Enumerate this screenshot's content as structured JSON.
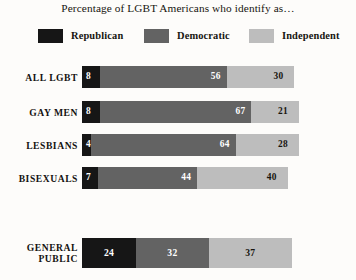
{
  "title": "Percentage of LGBT Americans who identify as…",
  "legend": {
    "items": [
      {
        "label": "Republican",
        "color": "#161616"
      },
      {
        "label": "Democratic",
        "color": "#636363"
      },
      {
        "label": "Independent",
        "color": "#bdbdbd"
      }
    ]
  },
  "colors": {
    "republican": "#161616",
    "democratic": "#636363",
    "independent": "#bdbdbd",
    "background": "#fdfcfa",
    "text": "#17150f",
    "value_light": "#ffffff"
  },
  "rows": [
    {
      "label": "ALL LGBT",
      "republican": 8,
      "democratic": 56,
      "independent": 30
    },
    {
      "label": "GAY MEN",
      "republican": 8,
      "democratic": 67,
      "independent": 21
    },
    {
      "label": "LESBIANS",
      "republican": 4,
      "democratic": 64,
      "independent": 28
    },
    {
      "label": "BISEXUALS",
      "republican": 7,
      "democratic": 44,
      "independent": 40
    },
    {
      "label": "GENERAL\nPUBLIC",
      "republican": 24,
      "democratic": 32,
      "independent": 37
    }
  ],
  "chart_data": {
    "type": "bar",
    "subtype": "horizontal-stacked",
    "title": "Percentage of LGBT Americans who identify as…",
    "xlabel": "",
    "ylabel": "",
    "categories": [
      "ALL LGBT",
      "GAY MEN",
      "LESBIANS",
      "BISEXUALS",
      "GENERAL PUBLIC"
    ],
    "series": [
      {
        "name": "Republican",
        "color": "#161616",
        "values": [
          8,
          8,
          4,
          7,
          24
        ]
      },
      {
        "name": "Democratic",
        "color": "#636363",
        "values": [
          56,
          67,
          64,
          44,
          32
        ]
      },
      {
        "name": "Independent",
        "color": "#bdbdbd",
        "values": [
          30,
          21,
          28,
          40,
          37
        ]
      }
    ],
    "value_labels": true,
    "grid": false,
    "legend_position": "top",
    "units": "percent",
    "xlim": [
      0,
      100
    ]
  }
}
